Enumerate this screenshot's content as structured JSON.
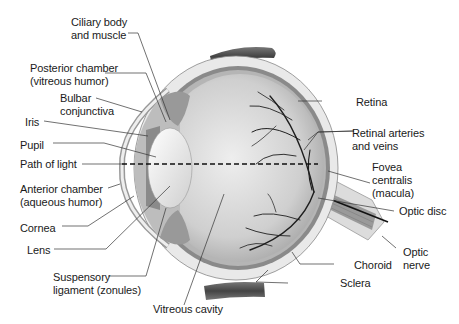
{
  "diagram": {
    "labels": {
      "ciliary_body": "Ciliary body\nand muscle",
      "posterior_chamber": "Posterior chamber\n(vitreous humor)",
      "bulbar_conjunctiva": "Bulbar\nconjunctiva",
      "iris": "Iris",
      "pupil": "Pupil",
      "path_of_light": "Path of light",
      "anterior_chamber": "Anterior chamber\n(aqueous humor)",
      "cornea": "Cornea",
      "lens": "Lens",
      "suspensory_ligament": "Suspensory\nligament (zonules)",
      "vitreous_cavity": "Vitreous cavity",
      "retina": "Retina",
      "retinal_vessels": "Retinal arteries\nand veins",
      "fovea": "Fovea\ncentralis\n(macula)",
      "optic_disc": "Optic disc",
      "optic_nerve": "Optic\nnerve",
      "choroid": "Choroid",
      "sclera": "Sclera"
    },
    "colors": {
      "background": "#ffffff",
      "sclera": "#e6e6e6",
      "choroid": "#8c8c8c",
      "vitreous": "#d2d2d2",
      "vessels": "#1e1e1e",
      "muscle": "#555555",
      "leader_lines": "#333333"
    }
  }
}
